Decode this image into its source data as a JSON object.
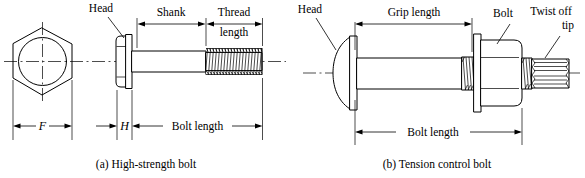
{
  "figure": {
    "panels": [
      {
        "id": "panel-a",
        "caption": "(a) High-strength bolt",
        "labels": {
          "head": "Head",
          "shank": "Shank",
          "thread_length_line1": "Thread",
          "thread_length_line2": "length",
          "across_flats": "F",
          "head_height": "H",
          "bolt_length": "Bolt length"
        }
      },
      {
        "id": "panel-b",
        "caption": "(b) Tension control bolt",
        "labels": {
          "head": "Head",
          "grip_length": "Grip length",
          "bolt": "Bolt",
          "twist_off_line1": "Twist off",
          "twist_off_line2": "tip",
          "bolt_length": "Bolt length"
        }
      }
    ],
    "colors": {
      "ink": "#000000",
      "background": "#ffffff"
    }
  }
}
